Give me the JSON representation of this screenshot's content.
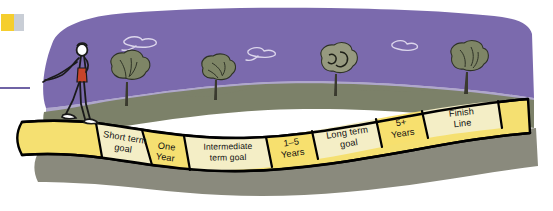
{
  "illustration": {
    "title": "Goal timeline road illustration",
    "alt_description": "A person walking along a winding road divided into labeled milestone segments",
    "colors": {
      "sky": "#7B6AAD",
      "sky_shadow": "#6E5EA0",
      "upper_ground": "#7C8169",
      "lower_ground": "#8A8A7D",
      "road_fill_dark": "#F5E071",
      "road_fill_light": "#F4EEC6",
      "road_outline": "#000000",
      "tree_foliage": "#7E8566",
      "tree_trunk": "#3A3A2E",
      "figure_outline": "#1A1A1A",
      "figure_garment": "#C8442A",
      "cloud_outline": "#D8D2E8",
      "corner_marker_yellow": "#F5CE2E",
      "corner_marker_gray": "#C9CED6",
      "edge_rule": "#6F63A5",
      "page_background": "#FFFFFF"
    },
    "road_segments": [
      {
        "id": "short-term-goal",
        "lines": [
          "Short term",
          "goal"
        ],
        "shade": "light"
      },
      {
        "id": "one-year",
        "lines": [
          "One",
          "Year"
        ],
        "shade": "dark"
      },
      {
        "id": "intermediate-term-goal",
        "lines": [
          "Intermediate",
          "term goal"
        ],
        "shade": "light"
      },
      {
        "id": "one-to-five-years",
        "lines": [
          "1–5",
          "Years"
        ],
        "shade": "dark"
      },
      {
        "id": "long-term-goal",
        "lines": [
          "Long term",
          "goal"
        ],
        "shade": "light"
      },
      {
        "id": "five-plus-years",
        "lines": [
          "5+",
          "Years"
        ],
        "shade": "dark"
      },
      {
        "id": "finish-line",
        "lines": [
          "Finish",
          "Line"
        ],
        "shade": "light"
      }
    ],
    "scenery": {
      "trees_count": 4,
      "clouds_count": 3,
      "walker_label": "walking person"
    }
  }
}
